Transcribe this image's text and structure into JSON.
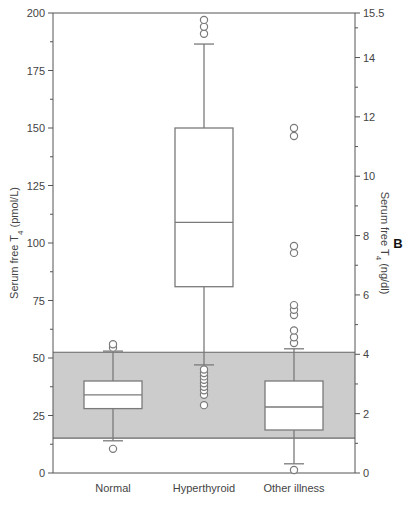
{
  "chart_data": {
    "type": "box",
    "title": "",
    "panel_label": "B",
    "categories": [
      "Normal",
      "Hyperthyroid",
      "Other illness"
    ],
    "xlabel": "",
    "ylabel": "Serum free T4 (pmol/L)",
    "ylabel_parts": {
      "prefix": "Serum free T",
      "sub": "4",
      "suffix": " (pmol/L)"
    },
    "ylim": [
      0,
      200
    ],
    "yticks": [
      0,
      25,
      50,
      75,
      100,
      125,
      150,
      175,
      200
    ],
    "y2label": "Serum free T4 (ng/dl)",
    "y2label_parts": {
      "prefix": "Serum free T",
      "sub": "4",
      "suffix": " (ng/dl)"
    },
    "y2lim": [
      0,
      15.5
    ],
    "y2ticks": [
      0,
      2,
      4,
      6,
      8,
      10,
      12,
      14,
      15.5
    ],
    "reference_band": {
      "low": 15.2,
      "high": 52.5,
      "color": "#cccccc",
      "label": "normal reference range"
    },
    "grid": false,
    "legend": null,
    "boxes": [
      {
        "category": "Normal",
        "whisker_low": 14,
        "q1": 28,
        "median": 34,
        "q3": 40,
        "whisker_high": 53,
        "outliers": [
          10.5,
          54.5,
          56
        ]
      },
      {
        "category": "Hyperthyroid",
        "whisker_low": 47,
        "q1": 81,
        "median": 109,
        "q3": 150,
        "whisker_high": 186.5,
        "outliers": [
          29.5,
          34,
          36,
          37.5,
          39,
          40.5,
          42,
          43.5,
          45,
          191,
          194,
          197
        ]
      },
      {
        "category": "Other illness",
        "whisker_low": 4,
        "q1": 18.7,
        "median": 28.7,
        "q3": 40,
        "whisker_high": 54,
        "outliers": [
          1.3,
          56.5,
          59,
          62,
          68.7,
          71,
          73,
          95.7,
          98.7,
          146.5,
          150
        ]
      }
    ]
  },
  "footer": {
    "caption_fragment": ""
  },
  "colors": {
    "band": "#cccccc",
    "line": "#7a7a7a",
    "axis": "#555555",
    "box_fill": "#ffffff"
  }
}
